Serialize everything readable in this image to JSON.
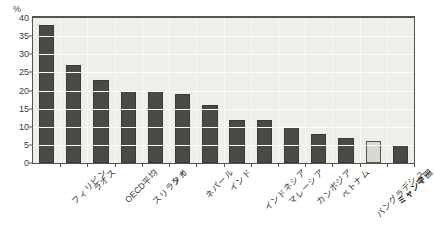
{
  "chart_data": {
    "type": "bar",
    "title": "",
    "xlabel": "",
    "ylabel": "%",
    "unit_label": "%",
    "ylim": [
      0,
      40
    ],
    "ytick_values": [
      0,
      5,
      10,
      15,
      20,
      25,
      30,
      35,
      40
    ],
    "ytick_labels": [
      "0",
      "5",
      "10",
      "15",
      "20",
      "25",
      "30",
      "35",
      "40"
    ],
    "grid": true,
    "legend": "none",
    "categories": [
      "フィリピン",
      "ラオス",
      "OECD平均",
      "スリランカ",
      "タイ",
      "ネパール",
      "インド",
      "インドネシア",
      "マレーシア",
      "カンボジア",
      "ベトナム",
      "バングラデシュ",
      "ミャンマー",
      "中国"
    ],
    "values": [
      38,
      27,
      23,
      20,
      20,
      19,
      16,
      12,
      12,
      10,
      8,
      7,
      6,
      5
    ],
    "highlight_index": 12,
    "highlight_category": "ミャンマー",
    "colors": {
      "bar": "#4a4a44",
      "bar_highlight": "#d9d9d1",
      "bar_outline": "#3a3a34",
      "plot_background": "#efefe9",
      "axis": "#55554e",
      "gridline": "#fdfdfa",
      "text": "#35352f",
      "page_background": "#ffffff"
    }
  }
}
